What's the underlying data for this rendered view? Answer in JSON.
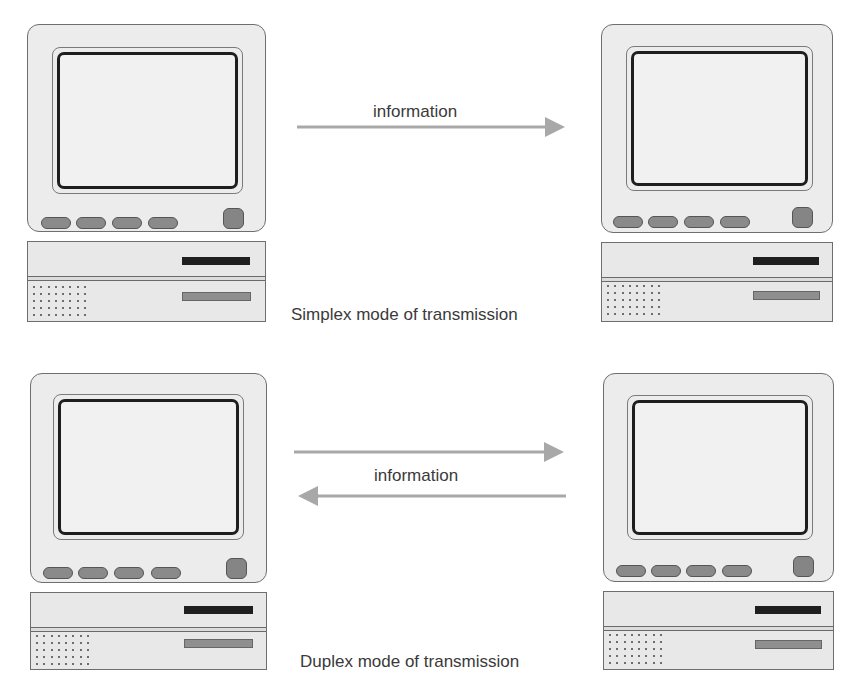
{
  "diagram": {
    "simplex": {
      "arrow_label": "information",
      "caption": "Simplex mode of transmission",
      "arrows": [
        {
          "direction": "left-to-right"
        }
      ]
    },
    "duplex": {
      "arrow_label": "information",
      "caption": "Duplex mode of transmission",
      "arrows": [
        {
          "direction": "left-to-right"
        },
        {
          "direction": "right-to-left"
        }
      ]
    },
    "computers": [
      {
        "id": "simplex-sender",
        "position": "top-left"
      },
      {
        "id": "simplex-receiver",
        "position": "top-right"
      },
      {
        "id": "duplex-node-a",
        "position": "bottom-left"
      },
      {
        "id": "duplex-node-b",
        "position": "bottom-right"
      }
    ],
    "colors": {
      "arrow": "#a8a8a8",
      "outline": "#6e6e6e",
      "screen_border": "#1e1e1e",
      "body_fill": "#ececec",
      "text": "#3a3a3a"
    }
  }
}
